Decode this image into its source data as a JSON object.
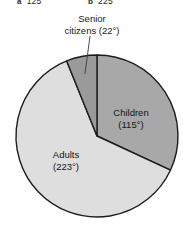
{
  "answers": {
    "items": [
      {
        "tag": "a",
        "value": "125"
      },
      {
        "tag": "b",
        "value": "225"
      }
    ]
  },
  "callout": {
    "line1": "Senior",
    "line2": "citizens (22°)"
  },
  "chart_data": {
    "type": "pie",
    "title": "",
    "total_degrees": 360,
    "start_angle_deg": 0,
    "direction": "clockwise",
    "legend_position": "none",
    "labels_inline": true,
    "categories": [
      "Children",
      "Adults",
      "Senior citizens"
    ],
    "values": [
      115,
      223,
      22
    ],
    "unit": "degrees",
    "slices": [
      {
        "name": "Children",
        "label_line1": "Children",
        "label_line2": "(115°)",
        "degrees": 115,
        "start_deg": 0,
        "end_deg": 115,
        "color": "#a8a8a8",
        "label_x": 131,
        "label_y": 116,
        "label_inside": true
      },
      {
        "name": "Adults",
        "label_line1": "Adults",
        "label_line2": "(223°)",
        "degrees": 223,
        "start_deg": 115,
        "end_deg": 338,
        "color": "#dedede",
        "label_x": 66,
        "label_y": 158,
        "label_inside": true
      },
      {
        "name": "Senior citizens",
        "label_line1": "Senior",
        "label_line2": "citizens (22°)",
        "degrees": 22,
        "start_deg": 338,
        "end_deg": 360,
        "color": "#9a9a9a",
        "label_inside": false,
        "callout": true
      }
    ],
    "geometry": {
      "center_x": 97,
      "center_y": 136,
      "radius": 81
    },
    "colors": {
      "outline": "#1d1d1d",
      "background": "#ffffff",
      "text": "#141414"
    }
  }
}
